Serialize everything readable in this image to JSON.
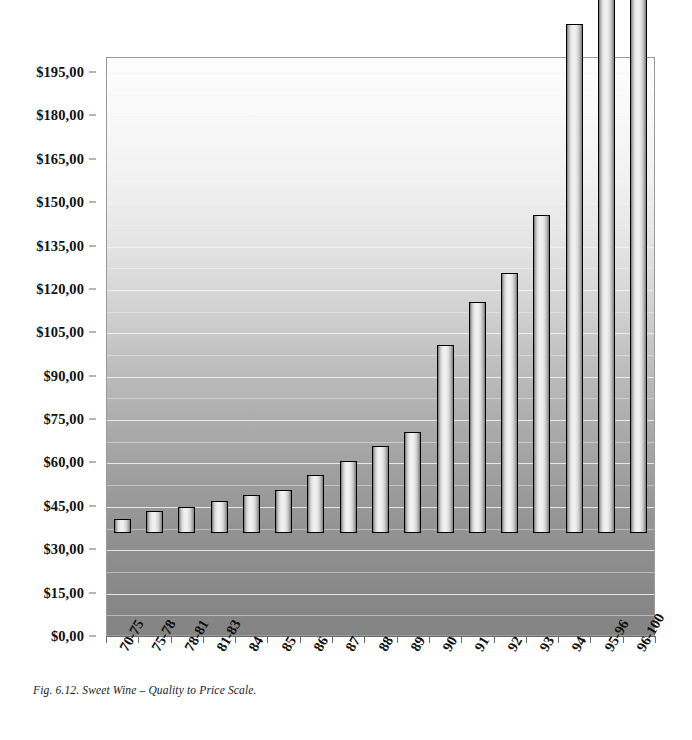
{
  "caption": "Fig. 6.12. Sweet Wine – Quality to Price Scale.",
  "chart_data": {
    "type": "bar",
    "title": "Sweet Wine – Quality to Price Scale",
    "xlabel": "",
    "ylabel": "",
    "categories": [
      "70-75",
      "75-78",
      "78-81",
      "81-83",
      "84",
      "85",
      "86",
      "87",
      "88",
      "89",
      "90",
      "91",
      "92",
      "93",
      "94",
      "95-96",
      "96-100"
    ],
    "values": [
      5,
      7.5,
      9,
      11,
      13,
      15,
      20,
      25,
      30,
      35,
      65,
      80,
      90,
      110,
      176,
      207,
      207
    ],
    "value_prefix": "$",
    "ylim": [
      0,
      195
    ],
    "ytick_step": 15,
    "ytick_labels": [
      "$0,00",
      "$15,00",
      "$30,00",
      "$45,00",
      "$60,00",
      "$75,00",
      "$90,00",
      "$105,00",
      "$120,00",
      "$135,00",
      "$150,00",
      "$165,00",
      "$180,00",
      "$195,00"
    ],
    "ytick_values": [
      0,
      15,
      30,
      45,
      60,
      75,
      90,
      105,
      120,
      135,
      150,
      165,
      180,
      195
    ],
    "grid": true,
    "grid_color": "#f4f4f4",
    "legend": false,
    "legend_position": "none",
    "plot_background": "vertical-gradient-white-to-gray",
    "bar_fill": "#ececec",
    "bar_outline": "#000000",
    "note": "last two bars (95-96, 96-100) extend above the plotted axis maximum"
  }
}
